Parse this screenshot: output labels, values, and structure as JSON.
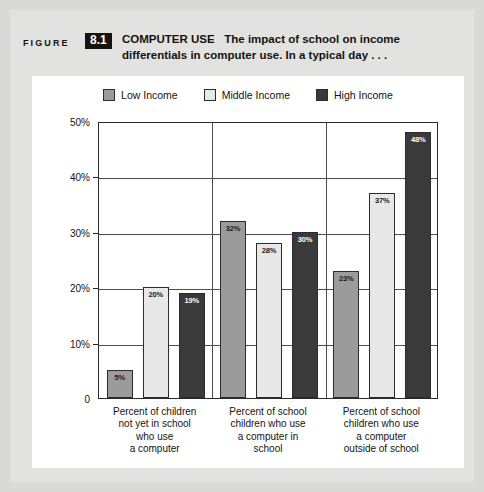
{
  "figure": {
    "label": "FIGURE",
    "number": "8.1",
    "title_strong": "COMPUTER USE",
    "title_line1": "The impact of school on income",
    "title_line2": "differentials in computer use. In a typical day . . ."
  },
  "chart_data": {
    "type": "bar",
    "title": "COMPUTER USE",
    "subtitle": "The impact of school on income differentials in computer use. In a typical day . . .",
    "xlabel": "",
    "ylabel": "",
    "ylim": [
      0,
      50
    ],
    "grid": true,
    "legend_position": "top-center",
    "ytick_labels": [
      "0",
      "10%",
      "20%",
      "30%",
      "40%",
      "50%"
    ],
    "ytick_values": [
      0,
      10,
      20,
      30,
      40,
      50
    ],
    "categories": [
      "Percent of children not yet in school who use a computer",
      "Percent of school children who use a computer in school",
      "Percent of school children who use a computer outside of school"
    ],
    "category_lines": [
      [
        "Percent of children",
        "not yet in school",
        "who use",
        "a computer"
      ],
      [
        "Percent of school",
        "children who use",
        "a computer in",
        "school"
      ],
      [
        "Percent of school",
        "children who use",
        "a computer",
        "outside of school"
      ]
    ],
    "series": [
      {
        "name": "Low Income",
        "color": "#9b9b9b",
        "label_color": "#1a1a1a",
        "values": [
          5,
          32,
          23
        ],
        "value_labels": [
          "5%",
          "32%",
          "23%"
        ]
      },
      {
        "name": "Middle Income",
        "color": "#e8e8e8",
        "label_color": "#1a1a1a",
        "values": [
          20,
          28,
          37
        ],
        "value_labels": [
          "20%",
          "28%",
          "37%"
        ]
      },
      {
        "name": "High Income",
        "color": "#3a3a3a",
        "label_color": "#ffffff",
        "values": [
          19,
          30,
          48
        ],
        "value_labels": [
          "19%",
          "30%",
          "48%"
        ]
      }
    ]
  },
  "colors": {
    "page_background": "#d9d9d7",
    "panel_background": "#e2e2e0",
    "card_background": "#ffffff",
    "axis": "#29292b",
    "text": "#16130f",
    "badge_background": "#17130f",
    "badge_text": "#ffffff"
  }
}
